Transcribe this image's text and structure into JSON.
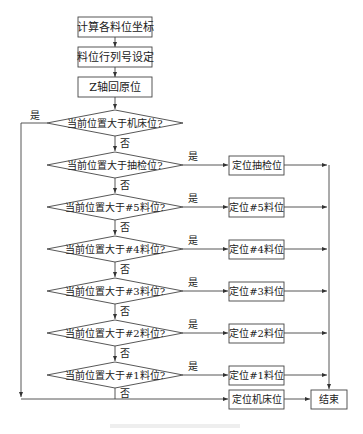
{
  "flowchart": {
    "process_steps": [
      {
        "label": "计算各料位坐标"
      },
      {
        "label": "料位行列号设定"
      },
      {
        "label": "Z轴回原位"
      }
    ],
    "decisions": [
      {
        "label": "当前位置大于机床位?",
        "yes_action": null
      },
      {
        "label": "当前位置大于抽检位?",
        "yes_action": "定位抽检位"
      },
      {
        "label": "当前位置大于#5料位?",
        "yes_action": "定位#5料位"
      },
      {
        "label": "当前位置大于#4料位?",
        "yes_action": "定位#4料位"
      },
      {
        "label": "当前位置大于#3料位?",
        "yes_action": "定位#3料位"
      },
      {
        "label": "当前位置大于#2料位?",
        "yes_action": "定位#2料位"
      },
      {
        "label": "当前位置大于#1料位?",
        "yes_action": "定位#1料位"
      }
    ],
    "yes_label": "是",
    "no_label": "否",
    "final_action": "定位机床位",
    "end_label": "结束"
  }
}
